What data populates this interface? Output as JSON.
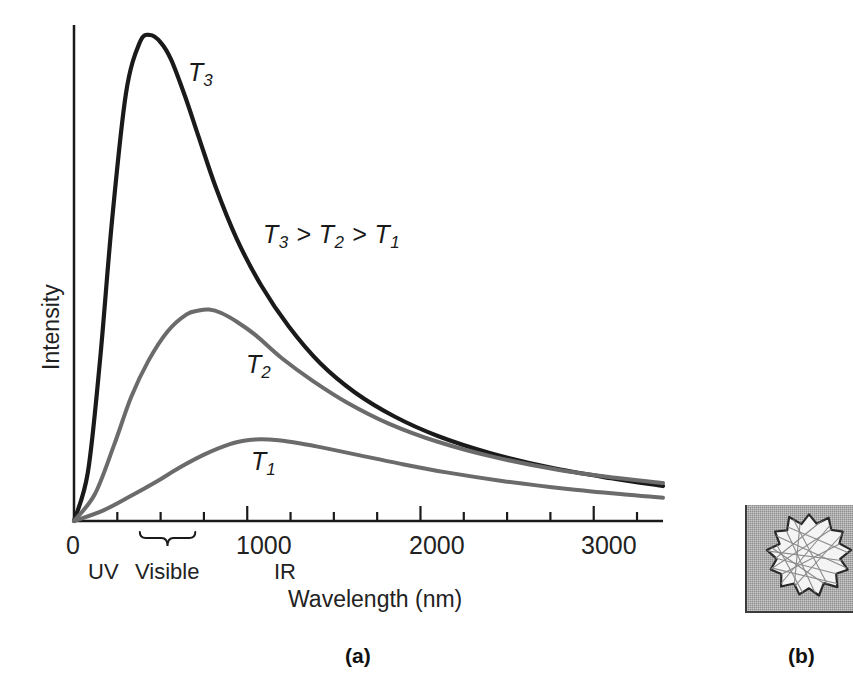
{
  "figure": {
    "panels": [
      {
        "id": "a",
        "caption": "(a)"
      },
      {
        "id": "b",
        "caption": "(b)"
      }
    ]
  },
  "chart_data": {
    "type": "line",
    "title": "",
    "xlabel": "Wavelength (nm)",
    "ylabel": "Intensity",
    "xlim": [
      0,
      3400
    ],
    "ylim": [
      0,
      1.0
    ],
    "grid": false,
    "legend": "inline-curve-labels",
    "xticks": [
      0,
      250,
      500,
      750,
      1000,
      1250,
      1500,
      1750,
      2000,
      2250,
      2500,
      2750,
      3000,
      3250
    ],
    "xtick_labels": [
      "0",
      "",
      "",
      "",
      "1000",
      "",
      "",
      "",
      "2000",
      "",
      "",
      "",
      "3000",
      ""
    ],
    "ytick_labels": [],
    "annotations": [
      {
        "text": "T3 > T2 > T1",
        "x": 1300,
        "y": 0.56
      },
      {
        "text": "UV",
        "x": 110,
        "y": -0.12
      },
      {
        "text": "Visible",
        "x": 420,
        "y": -0.12
      },
      {
        "text": "IR",
        "x": 1070,
        "y": -0.12
      }
    ],
    "visible_brace": {
      "from_nm": 380,
      "to_nm": 700
    },
    "series": [
      {
        "name": "T3",
        "label": "T3",
        "color": "#1a1a1a",
        "peak_nm": 500,
        "peak_intensity": 1.0,
        "x": [
          0,
          80,
          150,
          220,
          300,
          380,
          440,
          500,
          560,
          640,
          720,
          820,
          940,
          1080,
          1240,
          1420,
          1620,
          1850,
          2100,
          2400,
          2750,
          3100,
          3400
        ],
        "y": [
          0.0,
          0.1,
          0.33,
          0.62,
          0.88,
          0.985,
          1.0,
          0.985,
          0.95,
          0.875,
          0.79,
          0.685,
          0.58,
          0.485,
          0.4,
          0.325,
          0.265,
          0.215,
          0.175,
          0.14,
          0.11,
          0.088,
          0.072
        ]
      },
      {
        "name": "T2",
        "label": "T2",
        "color": "#6b6b6b",
        "peak_nm": 780,
        "peak_intensity": 0.435,
        "x": [
          0,
          120,
          230,
          330,
          430,
          540,
          650,
          720,
          780,
          850,
          940,
          1050,
          1200,
          1380,
          1580,
          1820,
          2100,
          2420,
          2800,
          3150,
          3400
        ],
        "y": [
          0.0,
          0.055,
          0.155,
          0.255,
          0.33,
          0.39,
          0.425,
          0.433,
          0.435,
          0.428,
          0.41,
          0.382,
          0.335,
          0.288,
          0.243,
          0.2,
          0.163,
          0.132,
          0.105,
          0.088,
          0.078
        ]
      },
      {
        "name": "T1",
        "label": "T1",
        "color": "#6b6b6b",
        "peak_nm": 1080,
        "peak_intensity": 0.168,
        "x": [
          0,
          170,
          330,
          480,
          620,
          760,
          900,
          1000,
          1080,
          1180,
          1300,
          1450,
          1650,
          1880,
          2150,
          2480,
          2850,
          3200,
          3400
        ],
        "y": [
          0.0,
          0.022,
          0.052,
          0.082,
          0.112,
          0.138,
          0.158,
          0.166,
          0.168,
          0.166,
          0.16,
          0.15,
          0.135,
          0.118,
          0.1,
          0.082,
          0.066,
          0.054,
          0.048
        ]
      }
    ]
  },
  "panel_b": {
    "description": "crystal-grain-diagram",
    "background_color": "#8e8e8e",
    "grain_fill": "#f4f4f4",
    "grain_outline": "#2a2a2a",
    "line_color": "#8a8a8a"
  }
}
